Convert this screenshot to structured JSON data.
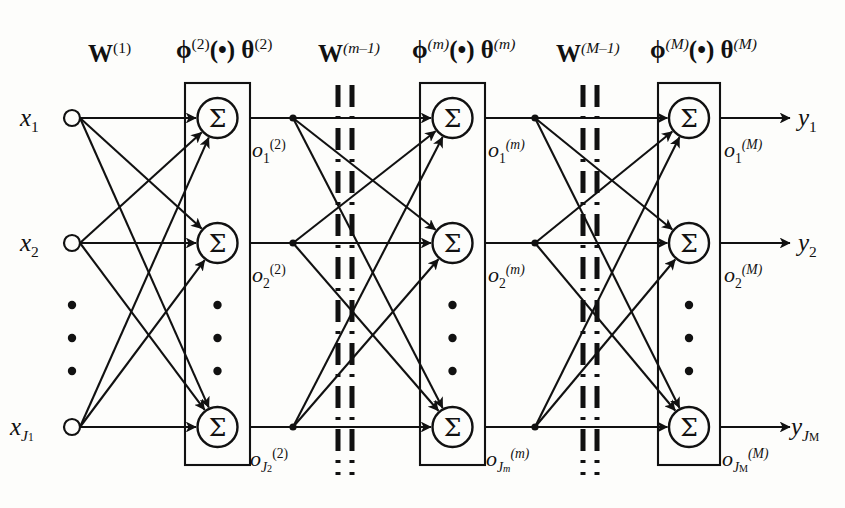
{
  "figure": {
    "type": "neural-network-diagram",
    "background_color": "#fdfdfb",
    "stroke_color": "#111111"
  },
  "weight_labels": [
    {
      "base": "W",
      "sup": "(1)"
    },
    {
      "base": "W",
      "sup": "(m–1)"
    },
    {
      "base": "W",
      "sup": "(M–1)"
    }
  ],
  "layer_labels": [
    {
      "phi": "ϕ",
      "phi_sup": "(2)",
      "dot": "(•)",
      "theta": "θ",
      "theta_sup": "(2)"
    },
    {
      "phi": "ϕ",
      "phi_sup": "(m)",
      "dot": "(•)",
      "theta": "θ",
      "theta_sup": "(m)"
    },
    {
      "phi": "ϕ",
      "phi_sup": "(M)",
      "dot": "(•)",
      "theta": "θ",
      "theta_sup": "(M)"
    }
  ],
  "inputs": [
    {
      "base": "x",
      "sub": "1"
    },
    {
      "base": "x",
      "sub": "2"
    },
    {
      "base": "x",
      "sub": "J",
      "sub2": "1"
    }
  ],
  "outputs": [
    {
      "base": "y",
      "sub": "1"
    },
    {
      "base": "y",
      "sub": "2"
    },
    {
      "base": "y",
      "sub": "J",
      "sub2": "M"
    }
  ],
  "layer_outputs": [
    [
      {
        "base": "o",
        "sub": "1",
        "sup": "(2)"
      },
      {
        "base": "o",
        "sub": "2",
        "sup": "(2)"
      },
      {
        "base": "o",
        "sub": "J",
        "sub2": "2",
        "sup": "(2)"
      }
    ],
    [
      {
        "base": "o",
        "sub": "1",
        "sup": "(m)"
      },
      {
        "base": "o",
        "sub": "2",
        "sup": "(m)"
      },
      {
        "base": "o",
        "sub": "J",
        "sub2": "m",
        "sup": "(m)"
      }
    ],
    [
      {
        "base": "o",
        "sub": "1",
        "sup": "(M)"
      },
      {
        "base": "o",
        "sub": "2",
        "sup": "(M)"
      },
      {
        "base": "o",
        "sub": "J",
        "sub2": "M",
        "sup": "(M)"
      }
    ]
  ],
  "neuron_symbol": "Σ",
  "vertical_ellipsis": "•",
  "geometry": {
    "input_x": 72,
    "rows_y": [
      118,
      243,
      427
    ],
    "layer_box_left": [
      185,
      420,
      658
    ],
    "layer_box_right": [
      250,
      485,
      720
    ],
    "box_top": 83,
    "box_bottom": 465,
    "neuron_radius": 20,
    "input_radius": 8,
    "branch_x": [
      293,
      535
    ],
    "break_x": [
      [
        338,
        352
      ],
      [
        583,
        597
      ]
    ],
    "output_arrow_end": 790
  }
}
